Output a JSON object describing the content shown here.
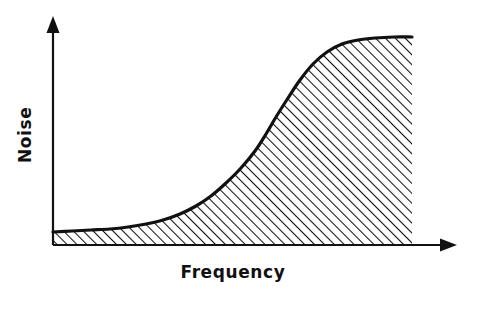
{
  "figure": {
    "background_color": "#ffffff",
    "ink_color": "#111111",
    "width": 483,
    "height": 317
  },
  "axes": {
    "x_axis": {
      "name": "x-axis-line",
      "label": "Frequency",
      "arrow": "arrow-right",
      "origin_px": [
        53,
        245
      ],
      "end_px": [
        455,
        245
      ]
    },
    "y_axis": {
      "name": "y-axis-line",
      "label": "Noise",
      "arrow": "arrow-up",
      "origin_px": [
        53,
        245
      ],
      "end_px": [
        53,
        18
      ]
    }
  },
  "labels": {
    "x_title": "Frequency",
    "y_title": "Noise"
  },
  "hatch": {
    "angle_deg": 45,
    "spacing_px": 7,
    "stroke_width_px": 2.1,
    "color": "#111111",
    "description": "diagonal-hatch-fill"
  },
  "chart_data": {
    "type": "area",
    "title": "",
    "subtitle": "",
    "xlabel": "Frequency",
    "ylabel": "Noise",
    "xlim": [
      0,
      1
    ],
    "ylim": [
      0,
      1
    ],
    "grid": false,
    "legend": null,
    "annotations": [],
    "axis_ticks": {
      "x_ticks": [],
      "y_ticks": []
    },
    "series": [
      {
        "name": "Noise",
        "fill": "hatched",
        "line_color": "#111111",
        "line_width_px": 3.2,
        "x": [
          0.0,
          0.05,
          0.1,
          0.15,
          0.2,
          0.25,
          0.3,
          0.35,
          0.4,
          0.45,
          0.5,
          0.55,
          0.6,
          0.65,
          0.7,
          0.75,
          0.8,
          0.85,
          0.9,
          0.95,
          1.0
        ],
        "y": [
          0.06,
          0.06,
          0.07,
          0.07,
          0.08,
          0.09,
          0.11,
          0.14,
          0.19,
          0.26,
          0.35,
          0.47,
          0.59,
          0.7,
          0.8,
          0.88,
          0.93,
          0.96,
          0.98,
          1.0,
          1.0
        ]
      }
    ],
    "curve_points_px": [
      [
        53,
        232
      ],
      [
        72,
        231
      ],
      [
        91,
        230
      ],
      [
        110,
        229
      ],
      [
        128,
        227
      ],
      [
        146,
        224
      ],
      [
        163,
        220
      ],
      [
        180,
        214
      ],
      [
        196,
        206
      ],
      [
        211,
        196
      ],
      [
        226,
        183
      ],
      [
        241,
        168
      ],
      [
        255,
        151
      ],
      [
        266,
        134
      ],
      [
        276,
        117
      ],
      [
        288,
        98
      ],
      [
        300,
        80
      ],
      [
        313,
        64
      ],
      [
        327,
        52
      ],
      [
        342,
        44
      ],
      [
        358,
        40
      ],
      [
        375,
        38
      ],
      [
        394,
        37
      ],
      [
        412,
        37
      ]
    ],
    "fill_right_edge_px": 412,
    "baseline_px": 245
  }
}
